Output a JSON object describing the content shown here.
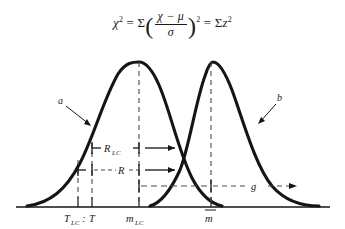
{
  "equation": {
    "lhs_var": "χ",
    "lhs_exp": "2",
    "equals": "=",
    "sigma": "Σ",
    "numerator": "χ − μ",
    "denominator": "σ",
    "paren_exp": "2",
    "equals2": "=",
    "rhs_sigma": "Σ",
    "rhs_var": "z",
    "rhs_exp": "2",
    "plain": "χ² = Σ((χ − μ)/σ)² = Σz²"
  },
  "diagram": {
    "curves": [
      {
        "id": "a",
        "label": "a",
        "peak_label": "m_LC"
      },
      {
        "id": "b",
        "label": "b",
        "peak_label": "m-bar"
      }
    ],
    "measures": [
      {
        "id": "R_LC",
        "label_main": "R",
        "label_sub": "LC",
        "from": "T",
        "to": "m_LC"
      },
      {
        "id": "R",
        "label_main": "R",
        "label_sub": "",
        "from": "T_LC",
        "to": "m_LC"
      },
      {
        "id": "g",
        "label_main": "g",
        "label_sub": "",
        "from": "m_LC",
        "to": "m-bar"
      }
    ],
    "axis_ticks": [
      {
        "id": "T_LC",
        "main": "T",
        "sub": "LC",
        "sep": ""
      },
      {
        "id": "T",
        "main": "T",
        "sub": "",
        "sep": ":"
      },
      {
        "id": "m_LC",
        "main": "m",
        "sub": "LC",
        "sep": ""
      },
      {
        "id": "m_bar",
        "main": "m",
        "sub": "",
        "sep": "",
        "overbar": true
      }
    ],
    "axis_tick_group_label": "T_LC : T",
    "colors": {
      "curve": "#151515",
      "axis": "#151515",
      "dashed": "#4a4a4a",
      "text": "#1a1a1a",
      "background": "#ffffff"
    }
  }
}
